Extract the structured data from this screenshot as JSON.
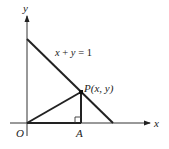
{
  "diagram": {
    "axes": {
      "x_label": "x",
      "y_label": "y",
      "origin_label": "O"
    },
    "line": {
      "equation": "x + y = 1",
      "eq_parts": [
        "x",
        " + ",
        "y",
        " = 1"
      ]
    },
    "points": {
      "P": {
        "label": "P(x, y)",
        "name": "P"
      },
      "A": {
        "label": "A"
      }
    },
    "features": [
      "segment OP",
      "segment PA perpendicular to x-axis",
      "segment OA",
      "right-angle marker at A"
    ],
    "colors": {
      "stroke": "#222222",
      "background": "#ffffff"
    }
  }
}
